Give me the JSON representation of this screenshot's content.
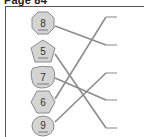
{
  "page": {
    "title": "Page 84"
  },
  "exercise": {
    "type": "matching",
    "left_items": [
      {
        "label": "8",
        "shape": "octagon-round",
        "cx": 43,
        "cy": 23
      },
      {
        "label": "5",
        "shape": "pentagon",
        "cx": 43,
        "cy": 51
      },
      {
        "label": "7",
        "shape": "blob",
        "cx": 43,
        "cy": 77
      },
      {
        "label": "6",
        "shape": "hexagon",
        "cx": 43,
        "cy": 102
      },
      {
        "label": "9",
        "shape": "circle",
        "cx": 43,
        "cy": 126
      }
    ],
    "right_endpoints": [
      {
        "index": 1,
        "y": 17
      },
      {
        "index": 2,
        "y": 45
      },
      {
        "index": 3,
        "y": 73
      },
      {
        "index": 4,
        "y": 100
      },
      {
        "index": 5,
        "y": 128
      }
    ],
    "connections": [
      {
        "from": "8",
        "to": 2
      },
      {
        "from": "5",
        "to": 5
      },
      {
        "from": "7",
        "to": 4
      },
      {
        "from": "6",
        "to": 1
      },
      {
        "from": "9",
        "to": 3
      }
    ]
  },
  "colors": {
    "shape_fill": "#d4d4d4",
    "shape_stroke": "#8a8a8a",
    "line": "#8c8c8c",
    "frame": "#555555"
  }
}
